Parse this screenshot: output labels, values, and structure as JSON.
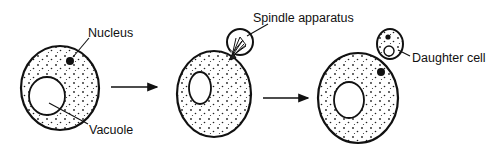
{
  "labels": {
    "nucleus": "Nucleus",
    "vacuole": "Vacuole",
    "spindle": "Spindle apparatus",
    "daughter": "Daughter cell"
  },
  "stages": [
    {
      "id": "stage-1",
      "description": "Parent cell with nucleus and vacuole"
    },
    {
      "id": "stage-2",
      "description": "Bud forming with spindle apparatus"
    },
    {
      "id": "stage-3",
      "description": "Daughter cell formed"
    }
  ],
  "colors": {
    "ink": "#111111",
    "background": "#ffffff"
  }
}
